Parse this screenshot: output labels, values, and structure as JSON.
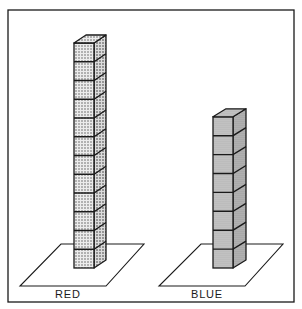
{
  "figure": {
    "type": "cube-tower-comparison",
    "frame": {
      "x": 8,
      "y": 10,
      "width": 286,
      "height": 292
    },
    "towers": [
      {
        "label": "RED",
        "cubes": 12,
        "pattern": "dotted-light",
        "fill": "#e4e4e4",
        "dot": "#555555"
      },
      {
        "label": "BLUE",
        "cubes": 8,
        "pattern": "dotted-dense",
        "fill": "#c9c9c9",
        "dot": "#6a6a6a"
      }
    ],
    "colors": {
      "line": "#1a1a1a",
      "background": "#ffffff"
    }
  }
}
